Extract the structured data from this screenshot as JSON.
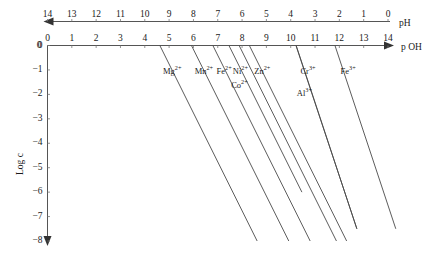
{
  "chart_data": {
    "type": "line",
    "title": "",
    "xlabel": "p OH",
    "xlabel_top": "pH",
    "ylabel": "Log c",
    "xlim": [
      0,
      14
    ],
    "ylim": [
      -8,
      0
    ],
    "grid": false,
    "legend": "inline-labels",
    "x_top_axis": {
      "name": "pH",
      "direction": "right-to-left",
      "ticks": [
        14,
        13,
        12,
        11,
        10,
        9,
        8,
        7,
        6,
        5,
        4,
        3,
        2,
        1,
        0
      ],
      "arrow": "left"
    },
    "x_bottom_axis": {
      "name": "p OH",
      "direction": "left-to-right",
      "ticks": [
        0,
        1,
        2,
        3,
        4,
        5,
        6,
        7,
        8,
        9,
        10,
        11,
        12,
        13,
        14
      ],
      "arrow": "right",
      "origin_label": "0"
    },
    "y_axis": {
      "name": "Log c",
      "ticks": [
        0,
        -1,
        -2,
        -3,
        -4,
        -5,
        -6,
        -7,
        -8
      ],
      "tick_labels": [
        "0",
        "−1",
        "−2",
        "−3",
        "−4",
        "−5",
        "−6",
        "−7",
        "−8"
      ],
      "arrow": "down"
    },
    "series": [
      {
        "name": "Mg2+",
        "label": "Mg",
        "charge": "2+",
        "slope": -2,
        "x_at_logc_0": 4.62,
        "x_start": 4.62,
        "y_start": 0,
        "x_end": 8.62,
        "y_end": -8
      },
      {
        "name": "Mn2+",
        "label": "Mn",
        "charge": "2+",
        "slope": -2,
        "x_at_logc_0": 5.92,
        "x_start": 5.92,
        "y_start": 0,
        "x_end": 9.92,
        "y_end": -8
      },
      {
        "name": "Fe2+",
        "label": "Fe",
        "charge": "2+",
        "slope": -2,
        "x_at_logc_0": 6.8,
        "x_start": 6.8,
        "y_start": 0,
        "x_end": 10.8,
        "y_end": -8
      },
      {
        "name": "Ni2+",
        "label": "Ni",
        "charge": "2+",
        "slope": -2,
        "x_at_logc_0": 7.46,
        "x_start": 7.46,
        "y_start": 0,
        "x_end": 10.46,
        "y_end": -6
      },
      {
        "name": "Co2+",
        "label": "Co",
        "charge": "2+",
        "slope": -2,
        "x_at_logc_0": 7.88,
        "x_start": 7.88,
        "y_start": 0,
        "x_end": 11.88,
        "y_end": -8
      },
      {
        "name": "Zn2+",
        "label": "Zn",
        "charge": "2+",
        "slope": -2,
        "x_at_logc_0": 8.3,
        "x_start": 8.3,
        "y_start": 0,
        "x_end": 12.3,
        "y_end": -8
      },
      {
        "name": "Cr3+",
        "label": "Cr",
        "charge": "3+",
        "slope": -3,
        "x_at_logc_0": 10.22,
        "x_start": 10.22,
        "y_start": 0,
        "x_end": 12.72,
        "y_end": -7.5
      },
      {
        "name": "Al3+",
        "label": "Al",
        "charge": "3+",
        "slope": -3,
        "x_at_logc_0": 10.22,
        "x_start": 10.22,
        "y_start": 0,
        "x_end": 12.72,
        "y_end": -7.5
      },
      {
        "name": "Fe3+",
        "label": "Fe",
        "charge": "3+",
        "slope": -3,
        "x_at_logc_0": 11.82,
        "x_start": 11.82,
        "y_start": 0,
        "x_end": 14.32,
        "y_end": -7.5
      }
    ],
    "annotations": [
      {
        "text": "Mg",
        "sup": "2+",
        "x": 4.75,
        "y": -1.05
      },
      {
        "text": "Mn",
        "sup": "2+",
        "x": 6.05,
        "y": -1.05
      },
      {
        "text": "Fe",
        "sup": "2+",
        "x": 6.95,
        "y": -1.05
      },
      {
        "text": "Ni",
        "sup": "2+",
        "x": 7.62,
        "y": -1.05
      },
      {
        "text": "Co",
        "sup": "2+",
        "x": 7.55,
        "y": -1.62
      },
      {
        "text": "Zn",
        "sup": "2+",
        "x": 8.5,
        "y": -1.05
      },
      {
        "text": "Cr",
        "sup": "3+",
        "x": 10.4,
        "y": -1.05
      },
      {
        "text": "Al",
        "sup": "3+",
        "x": 10.25,
        "y": -1.95
      },
      {
        "text": "Fe",
        "sup": "3+",
        "x": 12.05,
        "y": -1.05
      }
    ]
  },
  "axes": {
    "ph_ticks": [
      "14",
      "13",
      "12",
      "11",
      "10",
      "9",
      "8",
      "7",
      "6",
      "5",
      "4",
      "3",
      "2",
      "1",
      "0"
    ],
    "poh_ticks": [
      "0",
      "1",
      "2",
      "3",
      "4",
      "5",
      "6",
      "7",
      "8",
      "9",
      "10",
      "11",
      "12",
      "13",
      "14"
    ],
    "poh_origin": "0",
    "ph_name": "pH",
    "poh_name": "p OH",
    "y_name": "Log c",
    "y_ticks": [
      "0",
      "−1",
      "−2",
      "−3",
      "−4",
      "−5",
      "−6",
      "−7",
      "−8"
    ],
    "y_origin": "0"
  },
  "ions": [
    {
      "sym": "Mg",
      "chg": "2+"
    },
    {
      "sym": "Mn",
      "chg": "2+"
    },
    {
      "sym": "Fe",
      "chg": "2+"
    },
    {
      "sym": "Ni",
      "chg": "2+"
    },
    {
      "sym": "Co",
      "chg": "2+"
    },
    {
      "sym": "Zn",
      "chg": "2+"
    },
    {
      "sym": "Cr",
      "chg": "3+"
    },
    {
      "sym": "Al",
      "chg": "3+"
    },
    {
      "sym": "Fe",
      "chg": "3+"
    }
  ]
}
